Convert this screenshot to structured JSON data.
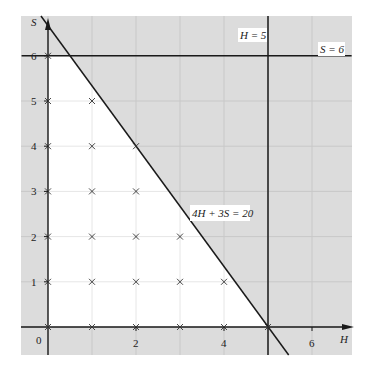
{
  "chart_data": {
    "type": "line",
    "title": "",
    "xlabel": "H",
    "ylabel": "S",
    "xlim": [
      -0.6,
      6.9
    ],
    "ylim": [
      -0.6,
      6.9
    ],
    "x_ticks": [
      {
        "value": 0,
        "label": "0"
      },
      {
        "value": 2,
        "label": "2"
      },
      {
        "value": 4,
        "label": "4"
      },
      {
        "value": 6,
        "label": "6"
      }
    ],
    "y_ticks": [
      {
        "value": 1,
        "label": "1"
      },
      {
        "value": 2,
        "label": "2"
      },
      {
        "value": 3,
        "label": "3"
      },
      {
        "value": 4,
        "label": "4"
      },
      {
        "value": 5,
        "label": "5"
      },
      {
        "value": 6,
        "label": "6"
      }
    ],
    "grid": true,
    "lines": [
      {
        "name": "4H + 3S = 20",
        "label": "4H + 3S = 20",
        "points": [
          [
            -0.16,
            6.88
          ],
          [
            5.47,
            -0.62
          ]
        ]
      },
      {
        "name": "H = 5",
        "label": "H = 5",
        "points": [
          [
            5,
            -0.62
          ],
          [
            5,
            6.88
          ]
        ]
      },
      {
        "name": "S = 6",
        "label": "S = 6",
        "points": [
          [
            -0.6,
            6
          ],
          [
            6.9,
            6
          ]
        ]
      }
    ],
    "feasible_region": [
      [
        0,
        0
      ],
      [
        5,
        0
      ],
      [
        0.5,
        6
      ],
      [
        0,
        6
      ]
    ],
    "lattice_points": [
      [
        0,
        0
      ],
      [
        1,
        0
      ],
      [
        2,
        0
      ],
      [
        3,
        0
      ],
      [
        4,
        0
      ],
      [
        5,
        0
      ],
      [
        0,
        1
      ],
      [
        1,
        1
      ],
      [
        2,
        1
      ],
      [
        3,
        1
      ],
      [
        4,
        1
      ],
      [
        0,
        2
      ],
      [
        1,
        2
      ],
      [
        2,
        2
      ],
      [
        3,
        2
      ],
      [
        0,
        3
      ],
      [
        1,
        3
      ],
      [
        2,
        3
      ],
      [
        0,
        4
      ],
      [
        1,
        4
      ],
      [
        2,
        4
      ],
      [
        0,
        5
      ],
      [
        1,
        5
      ],
      [
        0,
        6
      ]
    ],
    "colors": {
      "shaded": "#dcdcdc",
      "feasible": "#ffffff",
      "grid_shaded": "#c8c8c8",
      "grid_feasible": "#e6e6e6",
      "line": "#1a1a1a"
    }
  },
  "labels": {
    "origin": "0",
    "x_axis": "H",
    "y_axis": "S",
    "constraint_main": "4H + 3S = 20",
    "constraint_h": "H = 5",
    "constraint_s": "S = 6"
  }
}
